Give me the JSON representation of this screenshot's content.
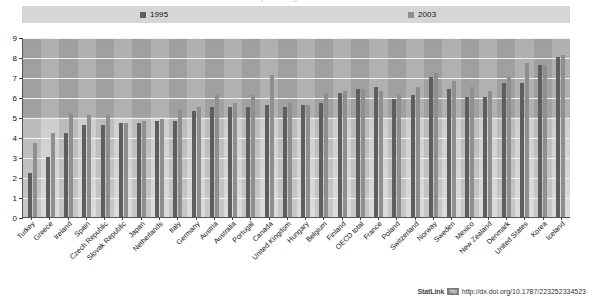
{
  "title_cut": "percentage of GDP",
  "legend": {
    "items": [
      {
        "label": "1995",
        "color": "#5e5e5e",
        "key": "s1995"
      },
      {
        "label": "2003",
        "color": "#8f8f8f",
        "key": "s2003"
      }
    ]
  },
  "footer": {
    "statlink_word": "StatLink",
    "statlink_badge": "http",
    "statlink_url": "http://dx.doi.org/10.1787/223252334523"
  },
  "chart_data": {
    "type": "bar",
    "title": "",
    "xlabel": "",
    "ylabel": "",
    "ylim": [
      0,
      9
    ],
    "yticks": [
      0,
      1,
      2,
      3,
      4,
      5,
      6,
      7,
      8,
      9
    ],
    "grid": true,
    "legend_position": "top",
    "categories": [
      "Turkey",
      "Greece",
      "Ireland",
      "Spain",
      "Czech Republic",
      "Slovak Republic",
      "Japan",
      "Netherlands",
      "Italy",
      "Germany",
      "Austria",
      "Australia",
      "Portugal",
      "Canada",
      "United Kingdom",
      "Hungary",
      "Belgium",
      "Finland",
      "OECD total",
      "France",
      "Poland",
      "Switzerland",
      "Norway",
      "Sweden",
      "Mexico",
      "New Zealand",
      "Denmark",
      "United States",
      "Korea",
      "Iceland"
    ],
    "series": [
      {
        "name": "1995",
        "color": "#5e5e5e",
        "values": [
          2.2,
          3.0,
          4.2,
          4.6,
          4.6,
          4.7,
          4.7,
          4.8,
          4.8,
          5.3,
          5.5,
          5.5,
          5.5,
          5.6,
          5.5,
          5.6,
          5.7,
          6.2,
          6.4,
          6.5,
          5.9,
          6.1,
          7.0,
          6.4,
          6.0,
          6.0,
          6.7,
          6.7,
          7.6,
          8.0
        ]
      },
      {
        "name": "2003",
        "color": "#8f8f8f",
        "values": [
          3.7,
          4.2,
          5.2,
          5.1,
          5.1,
          4.7,
          4.8,
          4.9,
          5.4,
          5.5,
          6.1,
          5.7,
          6.1,
          7.1,
          5.7,
          5.6,
          6.2,
          6.3,
          6.4,
          6.3,
          6.1,
          6.5,
          7.2,
          6.8,
          6.5,
          6.3,
          7.0,
          7.7,
          7.6,
          8.1
        ]
      }
    ]
  }
}
